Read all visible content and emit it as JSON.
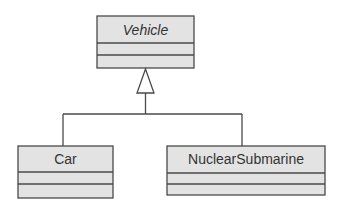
{
  "diagram": {
    "type": "uml-class-diagram",
    "classes": [
      {
        "id": "vehicle",
        "name": "Vehicle",
        "abstract": true,
        "attributes": [],
        "operations": []
      },
      {
        "id": "car",
        "name": "Car",
        "abstract": false,
        "attributes": [],
        "operations": []
      },
      {
        "id": "nuclear_submarine",
        "name": "NuclearSubmarine",
        "abstract": false,
        "attributes": [],
        "operations": []
      }
    ],
    "relationships": [
      {
        "type": "generalization",
        "from": "Car",
        "to": "Vehicle"
      },
      {
        "type": "generalization",
        "from": "NuclearSubmarine",
        "to": "Vehicle"
      }
    ],
    "colors": {
      "box_fill": "#e3e3e3",
      "stroke": "#4a4a4a",
      "text": "#333333"
    }
  }
}
